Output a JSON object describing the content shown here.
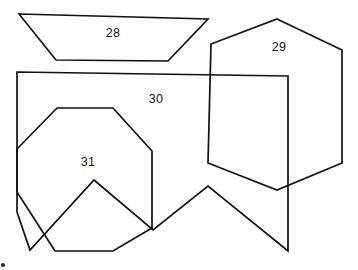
{
  "diagram": {
    "canvas": {
      "width": 358,
      "height": 270
    },
    "background_color": "#ffffff",
    "stroke_color": "#111111",
    "stroke_width": 1.7,
    "label_color": "#111111",
    "label_font_size": 12.5
  },
  "shapes": [
    {
      "id": "shape-28",
      "label": "28",
      "kind": "trapezoid",
      "sides": 4,
      "points": "19,14 208,19 168,61 56,60",
      "label_x": 113,
      "label_y": 34
    },
    {
      "id": "shape-29",
      "label": "29",
      "kind": "hexagon",
      "sides": 6,
      "points": "277,19 342,50 342,163 277,190 208,163 211,44",
      "label_x": 279,
      "label_y": 48
    },
    {
      "id": "shape-30",
      "label": "30",
      "kind": "irregular-polygon",
      "sides": 11,
      "points": "17,72 288,76 288,251 208,186 153,230 94,180 30,250 17,212 17,149 17,108 17,72",
      "label_x": 156,
      "label_y": 100
    },
    {
      "id": "shape-31",
      "label": "31",
      "kind": "octagon",
      "sides": 8,
      "points": "57,108 113,108 152,151 152,228 113,251 55,251 17,192 17,149",
      "label_x": 88,
      "label_y": 163
    }
  ],
  "corner_mark": {
    "label": "corner-mark",
    "x": 3,
    "y": 265,
    "radius": 2.1
  }
}
